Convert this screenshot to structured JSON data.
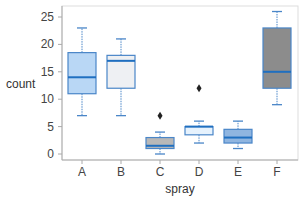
{
  "chart_data": {
    "type": "box",
    "title": "",
    "xlabel": "spray",
    "ylabel": "count",
    "ylim": [
      0,
      26
    ],
    "yticks": [
      0,
      5,
      10,
      15,
      20,
      25
    ],
    "categories": [
      "A",
      "B",
      "C",
      "D",
      "E",
      "F"
    ],
    "grid": false,
    "legend": "none",
    "boxes": [
      {
        "category": "A",
        "whisker_low": 7,
        "q1": 11,
        "median": 14,
        "q3": 18.5,
        "whisker_high": 23,
        "outliers": [],
        "fill": "#b9d7f5"
      },
      {
        "category": "B",
        "whisker_low": 7,
        "q1": 12,
        "median": 17,
        "q3": 18,
        "whisker_high": 21,
        "outliers": [],
        "fill": "#eef0f3"
      },
      {
        "category": "C",
        "whisker_low": 0,
        "q1": 1,
        "median": 1.5,
        "q3": 3,
        "whisker_high": 4,
        "outliers": [
          7
        ],
        "fill": "#b8b8b8"
      },
      {
        "category": "D",
        "whisker_low": 2,
        "q1": 3.5,
        "median": 5,
        "q3": 5,
        "whisker_high": 6,
        "outliers": [
          12
        ],
        "fill": "#e6f2fd"
      },
      {
        "category": "E",
        "whisker_low": 1,
        "q1": 2,
        "median": 3,
        "q3": 4.5,
        "whisker_high": 6,
        "outliers": [],
        "fill": "#8fb5e0"
      },
      {
        "category": "F",
        "whisker_low": 9,
        "q1": 12,
        "median": 15,
        "q3": 23,
        "whisker_high": 26,
        "outliers": [],
        "fill": "#8c8c8c"
      }
    ],
    "colors": {
      "box_edge": "#4a86c8",
      "median_line": "#1f6fc0",
      "whisker": "#4a86c8",
      "outlier": "#222222",
      "axis": "#aaaaaa"
    }
  }
}
